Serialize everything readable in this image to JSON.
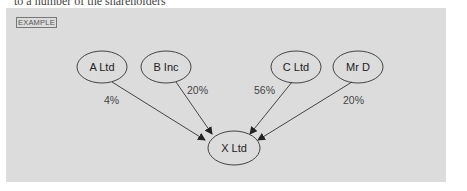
{
  "header_fragment": "to a number of the shareholders",
  "panel": {
    "tag": "EXAMPLE",
    "background": "#dcdcdc"
  },
  "diagram": {
    "nodes": [
      {
        "id": "a",
        "label": "A Ltd"
      },
      {
        "id": "b",
        "label": "B Inc"
      },
      {
        "id": "c",
        "label": "C Ltd"
      },
      {
        "id": "d",
        "label": "Mr D"
      },
      {
        "id": "x",
        "label": "X Ltd"
      }
    ],
    "edges": [
      {
        "from": "A Ltd",
        "to": "X Ltd",
        "label": "4%"
      },
      {
        "from": "B Inc",
        "to": "X Ltd",
        "label": "20%"
      },
      {
        "from": "C Ltd",
        "to": "X Ltd",
        "label": "56%"
      },
      {
        "from": "Mr D",
        "to": "X Ltd",
        "label": "20%"
      }
    ]
  }
}
